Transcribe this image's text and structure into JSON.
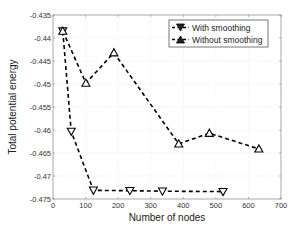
{
  "chart_data": {
    "type": "line",
    "title": "",
    "xlabel": "Number of nodes",
    "ylabel": "Total potential energy",
    "xlim": [
      0,
      700
    ],
    "ylim": [
      -0.475,
      -0.435
    ],
    "xticks": [
      0,
      100,
      200,
      300,
      400,
      500,
      600,
      700
    ],
    "xtick_labels": [
      "0",
      "100",
      "200",
      "300",
      "400",
      "500",
      "600",
      "700"
    ],
    "yticks": [
      -0.435,
      -0.44,
      -0.445,
      -0.45,
      -0.455,
      -0.46,
      -0.465,
      -0.47,
      -0.475
    ],
    "ytick_labels": [
      "-0.435",
      "-0.44",
      "-0.445",
      "-0.45",
      "-0.455",
      "-0.46",
      "-0.465",
      "-0.47",
      "-0.475"
    ],
    "grid": true,
    "legend_position": "upper right",
    "series": [
      {
        "name": "With smoothing",
        "marker": "triangle-down",
        "line_style": "dashed",
        "color": "#000000",
        "x": [
          30,
          56,
          124,
          236,
          336,
          522
        ],
        "y": [
          -0.4385,
          -0.4603,
          -0.4731,
          -0.4732,
          -0.4733,
          -0.4734
        ]
      },
      {
        "name": "Without smoothing",
        "marker": "triangle-up",
        "line_style": "dashed",
        "color": "#000000",
        "x": [
          30,
          101,
          187,
          386,
          480,
          632
        ],
        "y": [
          -0.4385,
          -0.4498,
          -0.4432,
          -0.463,
          -0.4607,
          -0.4641
        ]
      }
    ]
  }
}
